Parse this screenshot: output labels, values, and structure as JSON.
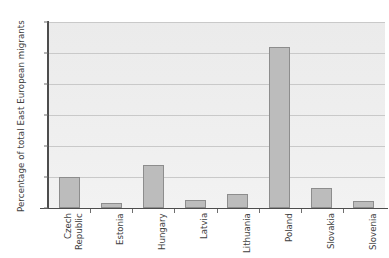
{
  "chart_data": {
    "type": "bar",
    "title": "",
    "xlabel": "",
    "ylabel": "Percentage of total East European migrants",
    "categories": [
      "Czech Republic",
      "Estonia",
      "Hungary",
      "Latvia",
      "Lithuania",
      "Poland",
      "Slovakia",
      "Slovenia"
    ],
    "category_lines": [
      [
        "Czech",
        "Republic"
      ],
      [
        "Estonia"
      ],
      [
        "Hungary"
      ],
      [
        "Latvia"
      ],
      [
        "Lithuania"
      ],
      [
        "Poland"
      ],
      [
        "Slovakia"
      ],
      [
        "Slovenia"
      ]
    ],
    "values": [
      10,
      1.6,
      14,
      2.6,
      4.6,
      52,
      6.4,
      2.3
    ],
    "ylim": [
      0,
      60
    ],
    "yticks": [
      0,
      10,
      20,
      30,
      40,
      50,
      60
    ],
    "ytick_labels": [
      "0",
      "10",
      "20",
      "30",
      "40",
      "50",
      "60"
    ],
    "grid": true,
    "grid_axis": "y",
    "legend": "none",
    "bar_color": "#bcbcbc",
    "bar_edge_color": "#8d8d8d",
    "plot_background": "#eeeeee",
    "axis_color": "#4d4d4d",
    "gridline_color": "#c9c9c9",
    "figure_background": "#ffffff"
  }
}
